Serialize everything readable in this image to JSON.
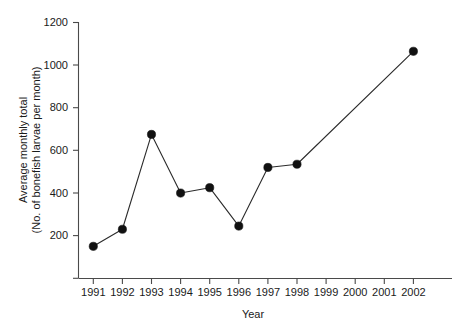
{
  "chart_data": {
    "type": "line",
    "title": "",
    "xlabel": "Year",
    "ylabel_line1": "Average monthly total",
    "ylabel_line2": "(No. of bonefish larvae per month)",
    "categories": [
      "1991",
      "1992",
      "1993",
      "1994",
      "1995",
      "1996",
      "1997",
      "1998",
      "1999",
      "2000",
      "2001",
      "2002"
    ],
    "x": [
      1991,
      1992,
      1993,
      1994,
      1995,
      1996,
      1997,
      1998,
      1999,
      2000,
      2001,
      2002
    ],
    "values": [
      150,
      230,
      675,
      400,
      425,
      245,
      520,
      535,
      null,
      null,
      null,
      1065
    ],
    "xlim": [
      1990.5,
      2002.5
    ],
    "ylim": [
      0,
      1200
    ],
    "yticks": [
      0,
      200,
      400,
      600,
      800,
      1000,
      1200
    ],
    "ytick_labels": [
      "",
      "200",
      "400",
      "600",
      "800",
      "1000",
      "1200"
    ],
    "grid": false,
    "legend": false,
    "marker": "filled-circle",
    "line_color": "#2b2b2b",
    "marker_color": "#111111"
  },
  "axes": {
    "x_axis_name": "year-axis",
    "y_axis_name": "average-monthly-total-axis"
  }
}
